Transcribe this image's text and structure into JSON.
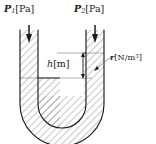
{
  "figure": {
    "name": "u-tube-manometer-diagram",
    "type": "technical-diagram",
    "background_color": "#ffffff",
    "line_color": "#1a1a1a",
    "guide_line_color": "#9a9a9a",
    "hatch_color": "#4d4d4d",
    "fill_color": "#ffffff"
  },
  "labels": {
    "pressure_left": {
      "symbol": "P",
      "subscript": "1",
      "unit": "[Pa]"
    },
    "pressure_right": {
      "symbol": "P",
      "subscript": "2",
      "unit": "[Pa]"
    },
    "height": {
      "symbol": "h",
      "unit": "[m]"
    },
    "specific_weight": {
      "symbol": "r",
      "unit": "[N/m",
      "unit_exponent": "3",
      "unit_close": "]"
    }
  },
  "annotations": {
    "arrow_left_direction": "down",
    "arrow_right_direction": "down",
    "dimension_arrow": "double-headed-vertical",
    "leader_line": "from-right-tube-fluid-to-r-label"
  },
  "geometry": {
    "left_tube_outer_x": 20,
    "left_tube_inner_x": 38,
    "right_tube_inner_x": 86,
    "right_tube_outer_x": 104,
    "tube_top_y": 30,
    "left_fluid_level_y": 78,
    "right_fluid_level_y": 53,
    "bend_bottom_y": 132,
    "dimension_arrow_x": 83
  }
}
